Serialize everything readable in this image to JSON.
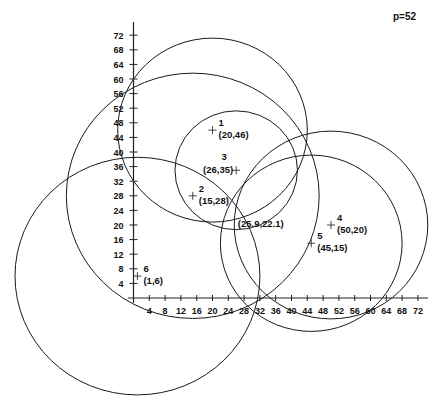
{
  "chart_data": {
    "type": "scatter",
    "title": "",
    "annotation_top_right": "p=52",
    "xlabel": "",
    "ylabel": "",
    "xlim": [
      0,
      72
    ],
    "ylim": [
      0,
      72
    ],
    "grid": false,
    "x_ticks": [
      4,
      8,
      12,
      16,
      20,
      24,
      28,
      32,
      36,
      40,
      44,
      48,
      52,
      56,
      60,
      64,
      68,
      72
    ],
    "y_ticks": [
      4,
      8,
      12,
      16,
      20,
      24,
      28,
      32,
      36,
      40,
      44,
      48,
      52,
      56,
      60,
      64,
      68,
      72
    ],
    "points": [
      {
        "id": "1",
        "x": 20,
        "y": 46,
        "label": "(20,46)",
        "circle_radius": 24
      },
      {
        "id": "2",
        "x": 15,
        "y": 28,
        "label": "(15,28)",
        "circle_radius": 32
      },
      {
        "id": "3",
        "x": 26,
        "y": 35,
        "label": "(26,35)",
        "circle_radius": 15.5
      },
      {
        "id": "4",
        "x": 50,
        "y": 20,
        "label": "(50,20)",
        "circle_radius": 24.5
      },
      {
        "id": "5",
        "x": 45,
        "y": 15,
        "label": "(45,15)",
        "circle_radius": 23
      },
      {
        "id": "6",
        "x": 1,
        "y": 6,
        "label": "(1,6)",
        "circle_radius": 31
      }
    ],
    "result_point": {
      "x": 25.9,
      "y": 22.1,
      "label": "(25.9,22.1)"
    }
  }
}
